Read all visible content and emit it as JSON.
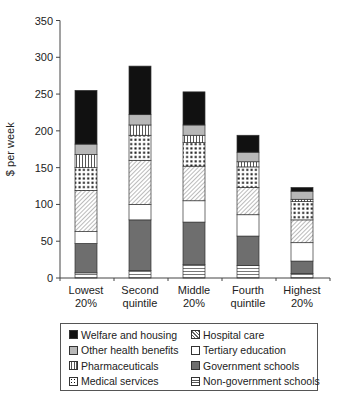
{
  "chart_data": {
    "type": "bar",
    "stacked": true,
    "title": "",
    "xlabel": "",
    "ylabel": "$ per week",
    "ylim": [
      0,
      350
    ],
    "yticks": [
      0,
      50,
      100,
      150,
      200,
      250,
      300,
      350
    ],
    "grid": false,
    "legend_position": "bottom",
    "categories": [
      "Lowest 20%",
      "Second quintile",
      "Middle 20%",
      "Fourth quintile",
      "Highest 20%"
    ],
    "category_lines": [
      [
        "Lowest",
        "20%"
      ],
      [
        "Second",
        "quintile"
      ],
      [
        "Middle",
        "20%"
      ],
      [
        "Fourth",
        "quintile"
      ],
      [
        "Highest",
        "20%"
      ]
    ],
    "series": [
      {
        "name": "Non-government schools",
        "pattern": "hlines",
        "values": [
          7,
          10,
          18,
          17,
          6
        ]
      },
      {
        "name": "Government schools",
        "pattern": "darkgrey",
        "values": [
          40,
          69,
          58,
          40,
          17
        ]
      },
      {
        "name": "Tertiary education",
        "pattern": "white",
        "values": [
          16,
          21,
          29,
          29,
          25
        ]
      },
      {
        "name": "Hospital care",
        "pattern": "diagonal",
        "values": [
          56,
          60,
          47,
          37,
          31
        ]
      },
      {
        "name": "Medical services",
        "pattern": "dots",
        "values": [
          31,
          34,
          32,
          28,
          25
        ]
      },
      {
        "name": "Pharmaceuticals",
        "pattern": "vlines",
        "values": [
          18,
          14,
          10,
          7,
          3
        ]
      },
      {
        "name": "Other health benefits",
        "pattern": "lightgrey",
        "values": [
          14,
          14,
          14,
          13,
          11
        ]
      },
      {
        "name": "Welfare and housing",
        "pattern": "black",
        "values": [
          73,
          66,
          45,
          23,
          5
        ]
      }
    ],
    "totals": [
      255,
      288,
      253,
      194,
      123
    ]
  },
  "legend": {
    "items": [
      {
        "label": "Welfare and housing",
        "pattern": "black"
      },
      {
        "label": "Hospital care",
        "pattern": "diagonal"
      },
      {
        "label": "Other health benefits",
        "pattern": "lightgrey"
      },
      {
        "label": "Tertiary education",
        "pattern": "white"
      },
      {
        "label": "Pharmaceuticals",
        "pattern": "vlines"
      },
      {
        "label": "Government schools",
        "pattern": "darkgrey"
      },
      {
        "label": "Medical services",
        "pattern": "dots"
      },
      {
        "label": "Non-government schools",
        "pattern": "hlines"
      }
    ]
  },
  "colors": {
    "black": "#111111",
    "darkgrey": "#6e6e6e",
    "lightgrey": "#b8b8b8",
    "white": "#ffffff",
    "axis": "#444444"
  }
}
